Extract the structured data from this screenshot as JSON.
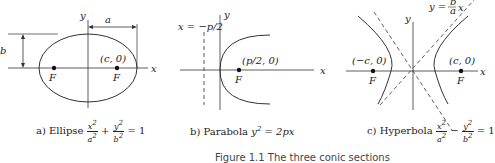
{
  "panels": [
    {
      "id": "ellipse",
      "axis_x": "x",
      "axis_y": "y",
      "dim_a": "a",
      "dim_b": "b",
      "focus_point": "(c, 0)",
      "focus_left": "F",
      "focus_right": "F",
      "caption_prefix": "a) Ellipse",
      "equation": {
        "t1_num": "x",
        "t1_den": "a",
        "op": "+",
        "t2_num": "y",
        "t2_den": "b",
        "exp": "2",
        "rhs": "= 1"
      }
    },
    {
      "id": "parabola",
      "axis_x": "x",
      "axis_y": "y",
      "directrix": "x = −p/2",
      "focus_point": "(p/2, 0)",
      "focus": "F",
      "caption_prefix": "b) Parabola",
      "equation": {
        "lhs": "y",
        "exp": "2",
        "rhs": "= 2px"
      }
    },
    {
      "id": "hyperbola",
      "axis_x": "x",
      "axis_y": "y",
      "asymptote": "y = b/a x",
      "asymptote_lhs": "y =",
      "asymptote_num": "b",
      "asymptote_den": "a",
      "asymptote_var": "x",
      "focus_left_point": "(−c, 0)",
      "focus_right_point": "(c, 0)",
      "focus_left": "F",
      "focus_right": "F",
      "caption_prefix": "c) Hyperbola",
      "equation": {
        "t1_num": "x",
        "t1_den": "a",
        "op": "−",
        "t2_num": "y",
        "t2_den": "b",
        "exp": "2",
        "rhs": "= 1"
      }
    }
  ],
  "figure_caption": "Figure 1.1 The three conic sections"
}
